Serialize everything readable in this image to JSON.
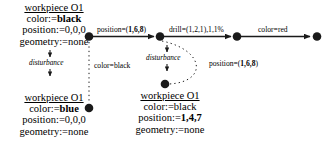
{
  "diagram": {
    "ink_color": "#1a1a1a",
    "background": "#ffffff",
    "states": [
      {
        "id": "state-initial",
        "title": "workpiece O1",
        "color_attr": "color:=",
        "color_value": "black",
        "position_attr": "position:=",
        "position_value": "0,0,0",
        "geometry_attr": "geometry:=",
        "geometry_value": "none"
      },
      {
        "id": "state-disturbed-blue",
        "title": "workpiece O1",
        "color_attr": "color:=",
        "color_value": "blue",
        "position_attr": "position:=",
        "position_value": "0,0,0",
        "geometry_attr": "geometry:=",
        "geometry_value": "none"
      },
      {
        "id": "state-moved",
        "title": "workpiece O1",
        "color_attr": "color:=",
        "color_value": "black",
        "position_attr": "position:=",
        "position_value": "1,4,7",
        "geometry_attr": "geometry:=",
        "geometry_value": "none"
      }
    ],
    "transitions": [
      {
        "id": "transition-position",
        "label_prefix": "position=(",
        "label_value": "1,6,8",
        "label_suffix": ")"
      },
      {
        "id": "transition-drill",
        "label_prefix": "drill=(",
        "label_value": "1,2,1",
        "label_suffix": "),1,1%"
      },
      {
        "id": "transition-color-red",
        "label_prefix": "color=red",
        "label_value": "",
        "label_suffix": ""
      }
    ],
    "disturbance_labels": [
      {
        "id": "disturbance-left",
        "text": "disturbance"
      },
      {
        "id": "disturbance-right",
        "text": "disturbance"
      }
    ],
    "observation_labels": [
      {
        "id": "observation-color-black",
        "prefix": "color=black",
        "value": "",
        "suffix": ""
      },
      {
        "id": "observation-position",
        "prefix": "position=(",
        "value": "1,6,8",
        "suffix": ")"
      }
    ]
  }
}
